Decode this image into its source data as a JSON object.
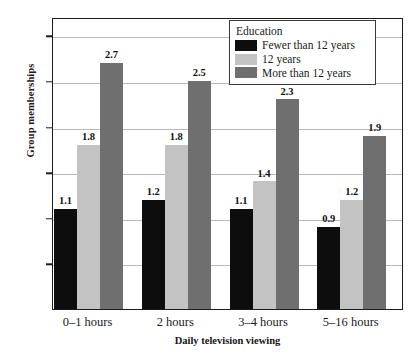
{
  "chart_data": {
    "type": "bar",
    "title": "",
    "xlabel": "Daily television viewing",
    "ylabel": "Group memberships",
    "categories": [
      "0–1 hours",
      "2 hours",
      "3–4 hours",
      "5–16 hours"
    ],
    "series": [
      {
        "name": "Fewer than 12 years",
        "color": "#0d0d0d",
        "values": [
          1.1,
          1.2,
          1.1,
          0.9
        ]
      },
      {
        "name": "12 years",
        "color": "#c3c3c3",
        "values": [
          1.8,
          1.8,
          1.4,
          1.2
        ]
      },
      {
        "name": "More than 12 years",
        "color": "#6f6f6f",
        "values": [
          2.7,
          2.5,
          2.3,
          1.9
        ]
      }
    ],
    "ylim": [
      0.0,
      3.2
    ],
    "yticks": [
      0.0,
      0.5,
      1.0,
      1.5,
      2.0,
      2.5,
      3.0
    ],
    "ytick_labels": [
      "0.0",
      "0.5",
      "1.0",
      "1.5",
      "2.0",
      "2.5",
      "3.0"
    ],
    "grid": true,
    "value_labels": true,
    "legend": {
      "title": "Education",
      "position": "top-right",
      "entries": [
        "Fewer than 12 years",
        "12 years",
        "More than 12 years"
      ]
    }
  }
}
